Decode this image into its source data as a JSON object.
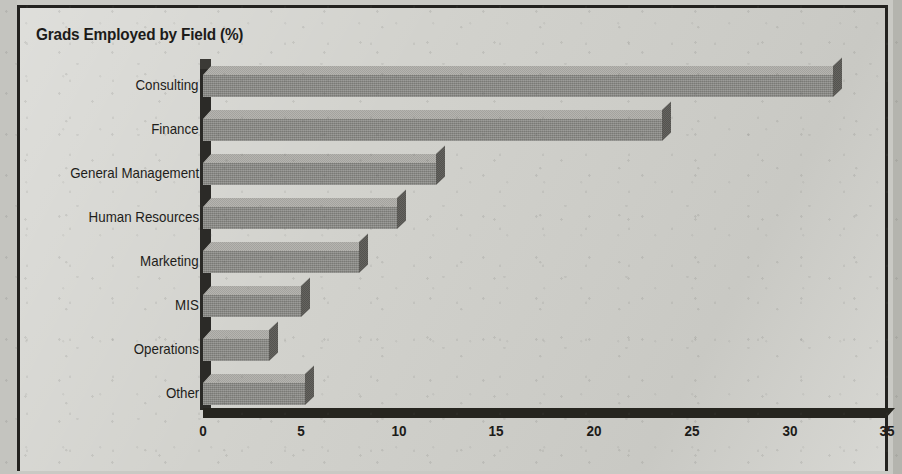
{
  "chart_data": {
    "type": "bar",
    "orientation": "horizontal",
    "title": "Grads Employed by Field (%)",
    "xlabel": "",
    "ylabel": "",
    "xlim": [
      0,
      35
    ],
    "xticks": [
      0,
      5,
      10,
      15,
      20,
      25,
      30,
      35
    ],
    "grid": false,
    "legend": null,
    "style": "3d-shaded-bars",
    "categories": [
      "Consulting",
      "Finance",
      "General Management",
      "Human Resources",
      "Marketing",
      "MIS",
      "Operations",
      "Other"
    ],
    "values": [
      32.2,
      23.5,
      11.9,
      9.9,
      8.0,
      5.0,
      3.4,
      5.2
    ],
    "units": "percent"
  },
  "colors": {
    "paper": "#d2d2cd",
    "frame_border": "#23221f",
    "bar_front": "#8a8a86",
    "bar_top": "#adaca7",
    "bar_side": "#595854",
    "axis": "#26251f",
    "text": "#1c1b19"
  }
}
